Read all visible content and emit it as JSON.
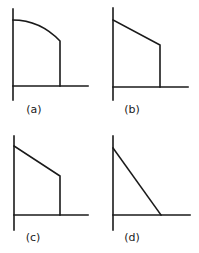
{
  "figure": {
    "panels": [
      {
        "id": "a",
        "label": "(a)",
        "shape": "convex-curve-then-vertical-drop",
        "axes": {
          "y_axis": {
            "x": 13,
            "y1": 9,
            "y2": 100
          },
          "x_axis": {
            "y": 86,
            "x1": 13,
            "x2": 88
          }
        },
        "path": "M13,20 Q40,20 60,41 L60,86",
        "label_pos": {
          "x": 34,
          "y": 113
        }
      },
      {
        "id": "b",
        "label": "(b)",
        "shape": "linear-decline-then-vertical-drop",
        "axes": {
          "y_axis": {
            "x": 113,
            "y1": 8,
            "y2": 100
          },
          "x_axis": {
            "y": 87,
            "x1": 113,
            "x2": 188
          }
        },
        "path": "M113,20 L160,45 L160,87",
        "label_pos": {
          "x": 132,
          "y": 113
        }
      },
      {
        "id": "c",
        "label": "(c)",
        "shape": "linear-decline-then-vertical-drop",
        "axes": {
          "y_axis": {
            "x": 14,
            "y1": 136,
            "y2": 230
          },
          "x_axis": {
            "y": 215,
            "x1": 14,
            "x2": 88
          }
        },
        "path": "M14,146 L60,176 L60,215",
        "label_pos": {
          "x": 33,
          "y": 241
        }
      },
      {
        "id": "d",
        "label": "(d)",
        "shape": "linear-decline-to-zero",
        "axes": {
          "y_axis": {
            "x": 113,
            "y1": 136,
            "y2": 230
          },
          "x_axis": {
            "y": 215,
            "x1": 113,
            "x2": 190
          }
        },
        "path": "M113,148 L161,215",
        "label_pos": {
          "x": 132,
          "y": 241
        }
      }
    ]
  },
  "colors": {
    "line": "#1a1a1a",
    "background": "#ffffff"
  }
}
